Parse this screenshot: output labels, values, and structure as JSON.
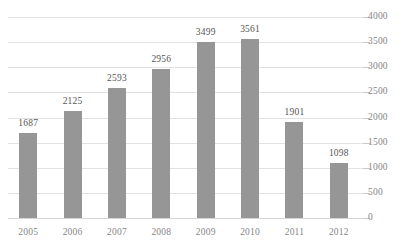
{
  "chart_data": {
    "type": "bar",
    "title": "",
    "subtitle": "",
    "xlabel": "",
    "ylabel": "",
    "categories": [
      "2005",
      "2006",
      "2007",
      "2008",
      "2009",
      "2010",
      "2011",
      "2012"
    ],
    "values": [
      1687,
      2125,
      2593,
      2956,
      3499,
      3561,
      1901,
      1098
    ],
    "series": [
      {
        "name": "",
        "values": [
          1687,
          2125,
          2593,
          2956,
          3499,
          3561,
          1901,
          1098
        ]
      }
    ],
    "data_labels": [
      "1687",
      "2125",
      "2593",
      "2956",
      "3499",
      "3561",
      "1901",
      "1098"
    ],
    "ylim": [
      0,
      4000
    ],
    "ytick_values": [
      0,
      500,
      1000,
      1500,
      2000,
      2500,
      3000,
      3500,
      4000
    ],
    "ytick_labels": [
      "0",
      "500",
      "1000",
      "1500",
      "2000",
      "2500",
      "3000",
      "3500",
      "4000"
    ],
    "y_axis_position": "right",
    "grid": true,
    "grid_axis": "y",
    "legend": false,
    "legend_entries": [],
    "annotations": [],
    "colors": {
      "bar": "#969696",
      "gridline": "#e2e2e2",
      "baseline": "#d5d5d5",
      "tick_label": "#868686",
      "data_label": "#555555",
      "background": "#ffffff"
    }
  }
}
